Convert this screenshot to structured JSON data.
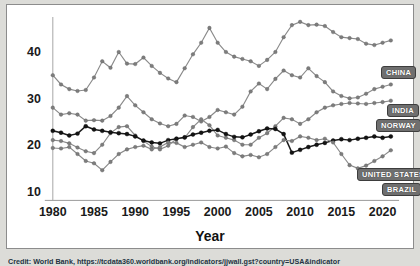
{
  "figure": {
    "credit": "Credit: World Bank, https://tcdata360.worldbank.org/indicators/jjwall.gst?country=USA&indicator",
    "frame_color": "#8c8c8c",
    "background_color": "#dcdcd8",
    "plot_background": "#ffffff"
  },
  "chart_data": {
    "type": "line",
    "title": "",
    "xlabel": "Year",
    "ylabel": "",
    "xlim": [
      1980,
      2022
    ],
    "ylim": [
      8,
      48
    ],
    "xticks": [
      1980,
      1985,
      1990,
      1995,
      2000,
      2005,
      2010,
      2015,
      2020
    ],
    "yticks": [
      10,
      20,
      30,
      40
    ],
    "grid": false,
    "legend_position": "right-inline-callout",
    "x": [
      1980,
      1981,
      1982,
      1983,
      1984,
      1985,
      1986,
      1987,
      1988,
      1989,
      1990,
      1991,
      1992,
      1993,
      1994,
      1995,
      1996,
      1997,
      1998,
      1999,
      2000,
      2001,
      2002,
      2003,
      2004,
      2005,
      2006,
      2007,
      2008,
      2009,
      2010,
      2011,
      2012,
      2013,
      2014,
      2015,
      2016,
      2017,
      2018,
      2019,
      2020,
      2021
    ],
    "series": [
      {
        "name": "CHINA",
        "color": "#8a8a8a",
        "marker_color": "#7d7d7d",
        "values": [
          35.0,
          33.0,
          32.0,
          31.6,
          31.8,
          34.5,
          38.0,
          36.6,
          40.0,
          37.5,
          37.4,
          38.8,
          37.0,
          35.5,
          34.3,
          33.5,
          36.5,
          39.5,
          42.0,
          45.2,
          42.0,
          40.0,
          39.0,
          38.5,
          38.0,
          37.0,
          38.3,
          40.0,
          43.2,
          45.8,
          46.5,
          45.8,
          45.9,
          45.6,
          44.3,
          43.2,
          43.0,
          42.8,
          41.8,
          41.5,
          42.0,
          42.5
        ]
      },
      {
        "name": "INDIA",
        "color": "#8a8a8a",
        "marker_color": "#7d7d7d",
        "values": [
          28.0,
          26.5,
          26.8,
          26.5,
          25.2,
          25.3,
          25.2,
          26.2,
          28.0,
          30.5,
          28.5,
          27.0,
          25.5,
          24.6,
          24.0,
          24.5,
          26.3,
          26.0,
          25.0,
          26.0,
          27.5,
          27.0,
          26.5,
          28.2,
          31.5,
          33.2,
          32.0,
          34.2,
          36.0,
          35.0,
          34.5,
          36.5,
          34.8,
          33.5,
          31.5,
          30.5,
          30.0,
          30.2,
          31.0,
          32.0,
          32.5,
          33.0
        ]
      },
      {
        "name": "NORWAY",
        "color": "#8a8a8a",
        "marker_color": "#7d7d7d",
        "values": [
          21.0,
          20.8,
          20.3,
          19.4,
          18.6,
          18.2,
          20.0,
          22.5,
          23.8,
          24.0,
          22.0,
          20.8,
          19.6,
          19.0,
          19.8,
          21.3,
          21.5,
          23.8,
          25.5,
          24.2,
          22.0,
          21.5,
          21.0,
          20.0,
          20.0,
          21.5,
          22.5,
          24.0,
          25.8,
          25.5,
          24.5,
          25.5,
          27.0,
          28.0,
          28.5,
          28.8,
          29.0,
          28.9,
          28.8,
          29.0,
          29.2,
          29.5
        ]
      },
      {
        "name": "UNITED STATES",
        "color": "#1c1c1c",
        "marker_color": "#141414",
        "values": [
          23.0,
          22.6,
          22.0,
          22.4,
          24.0,
          23.3,
          23.0,
          22.7,
          22.5,
          22.3,
          21.8,
          20.9,
          20.5,
          20.3,
          21.0,
          21.3,
          21.6,
          22.2,
          22.6,
          23.0,
          23.2,
          22.3,
          21.7,
          21.6,
          22.2,
          22.9,
          23.5,
          23.4,
          22.3,
          18.3,
          18.9,
          19.5,
          20.0,
          20.4,
          20.9,
          21.2,
          21.0,
          21.3,
          21.5,
          21.8,
          21.5,
          21.8
        ]
      },
      {
        "name": "BRAZIL",
        "color": "#8a8a8a",
        "marker_color": "#7d7d7d",
        "values": [
          19.3,
          19.2,
          19.5,
          18.0,
          16.5,
          16.0,
          14.5,
          16.3,
          18.0,
          19.0,
          19.5,
          19.8,
          19.0,
          19.5,
          20.5,
          20.4,
          19.5,
          20.0,
          20.5,
          19.5,
          19.2,
          19.6,
          18.2,
          17.5,
          17.8,
          17.3,
          18.0,
          19.5,
          21.0,
          20.8,
          21.8,
          21.5,
          21.0,
          21.3,
          20.5,
          18.0,
          15.6,
          14.9,
          15.5,
          16.5,
          17.5,
          18.8
        ]
      }
    ],
    "callouts": [
      {
        "label": "CHINA",
        "left": 374,
        "top": 61
      },
      {
        "label": "INDIA",
        "left": 380,
        "top": 99
      },
      {
        "label": "NORWAY",
        "left": 369,
        "top": 114
      },
      {
        "label": "UNITED STATES",
        "left": 350,
        "top": 163
      },
      {
        "label": "BRAZIL",
        "left": 375,
        "top": 178
      }
    ]
  }
}
